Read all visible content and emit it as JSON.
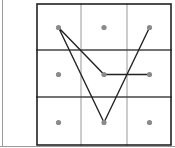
{
  "pattern_lock": {
    "grid": {
      "rows": 3,
      "cols": 3
    },
    "dots": [
      {
        "row": 0,
        "col": 0
      },
      {
        "row": 0,
        "col": 1
      },
      {
        "row": 0,
        "col": 2
      },
      {
        "row": 1,
        "col": 0
      },
      {
        "row": 1,
        "col": 1
      },
      {
        "row": 1,
        "col": 2
      },
      {
        "row": 2,
        "col": 0
      },
      {
        "row": 2,
        "col": 1
      },
      {
        "row": 2,
        "col": 2
      }
    ],
    "path": [
      {
        "row": 0,
        "col": 2
      },
      {
        "row": 2,
        "col": 1
      },
      {
        "row": 0,
        "col": 0
      },
      {
        "row": 1,
        "col": 1
      },
      {
        "row": 1,
        "col": 2
      }
    ],
    "colors": {
      "border": "#222222",
      "row_divider": "#444444",
      "col_divider": "#a8a8a8",
      "dot": "#8a8a8a",
      "path": "#222222"
    }
  }
}
